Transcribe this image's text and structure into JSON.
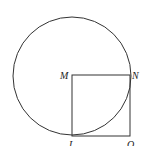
{
  "diagram": {
    "labels": {
      "M": "M",
      "N": "N",
      "L": "L",
      "O": "O"
    },
    "circle": {
      "cx": 72,
      "cy": 76,
      "r": 59
    },
    "square": {
      "x": 72,
      "y": 75,
      "size": 58
    },
    "colors": {
      "stroke": "#333333",
      "background": "#ffffff"
    }
  }
}
